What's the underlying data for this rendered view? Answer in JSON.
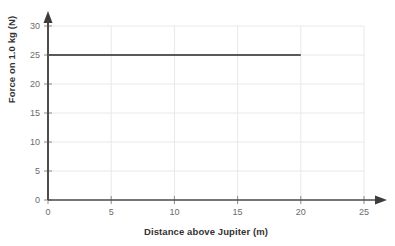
{
  "chart_data": {
    "type": "line",
    "title": "",
    "xlabel": "Distance above Jupiter (m)",
    "ylabel": "Force on 1.0 kg (N)",
    "xlim": [
      0,
      25
    ],
    "ylim": [
      0,
      30
    ],
    "xticks": [
      0,
      5,
      10,
      15,
      20,
      25
    ],
    "yticks": [
      0,
      5,
      10,
      15,
      20,
      25,
      30
    ],
    "xtick_labels": [
      "0",
      "5",
      "10",
      "15",
      "20",
      "25"
    ],
    "ytick_labels": [
      "0",
      "5",
      "10",
      "15",
      "20",
      "25",
      "30"
    ],
    "grid": true,
    "legend": "none",
    "series": [
      {
        "name": "Force on 1.0 kg",
        "color": "#595959",
        "x": [
          0,
          5,
          10,
          15,
          20
        ],
        "values": [
          25,
          25,
          25,
          25,
          25
        ]
      }
    ],
    "annotations": [],
    "axis_arrows": true
  },
  "colors": {
    "background": "#ffffff",
    "grid": "#e8e8e8",
    "axis": "#4d4d4d",
    "line": "#595959",
    "tick_text": "#6b6b6b",
    "label_text": "#333333"
  }
}
